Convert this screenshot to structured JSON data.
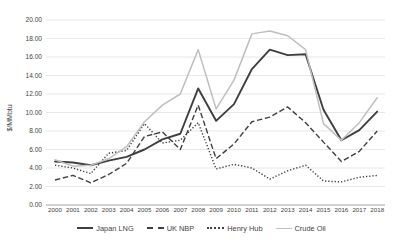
{
  "chart_data": {
    "type": "line",
    "title": "",
    "xlabel": "",
    "ylabel": "$/MMbtu",
    "ylim": [
      0,
      20
    ],
    "ytick_step": 2,
    "grid": "horizontal-only",
    "gridline_color": "#dcdcdc",
    "axis_color": "#999999",
    "legend_position": "bottom",
    "yticks": [
      "0.00",
      "2.00",
      "4.00",
      "6.00",
      "8.00",
      "10.00",
      "12.00",
      "14.00",
      "16.00",
      "18.00",
      "20.00"
    ],
    "x": [
      "2000",
      "2001",
      "2002",
      "2003",
      "2004",
      "2005",
      "2006",
      "2007",
      "2008",
      "2009",
      "2010",
      "2011",
      "2012",
      "2013",
      "2014",
      "2015",
      "2016",
      "2017",
      "2018"
    ],
    "series": [
      {
        "name": "Japan LNG",
        "color": "#3f3f3f",
        "line_style": "solid",
        "line_width": 1.9,
        "values": [
          4.7,
          4.6,
          4.3,
          4.8,
          5.2,
          6.0,
          7.1,
          7.7,
          12.6,
          9.1,
          10.9,
          14.7,
          16.8,
          16.2,
          16.3,
          10.3,
          7.0,
          8.1,
          10.1
        ]
      },
      {
        "name": "UK NBP",
        "color": "#3f3f3f",
        "line_style": "dashed",
        "line_width": 1.4,
        "values": [
          2.7,
          3.2,
          2.4,
          3.3,
          4.5,
          7.4,
          7.9,
          6.0,
          10.8,
          5.0,
          6.6,
          9.0,
          9.5,
          10.6,
          8.9,
          6.8,
          4.7,
          5.8,
          8.0
        ]
      },
      {
        "name": "Henry Hub",
        "color": "#3f3f3f",
        "line_style": "dotted",
        "line_width": 1.4,
        "values": [
          4.3,
          4.0,
          3.4,
          5.6,
          5.9,
          8.8,
          6.7,
          7.0,
          8.9,
          3.9,
          4.4,
          4.0,
          2.8,
          3.7,
          4.3,
          2.6,
          2.5,
          3.0,
          3.2
        ]
      },
      {
        "name": "Crude Oil",
        "color": "#bfbfbf",
        "line_style": "solid",
        "line_width": 1.5,
        "values": [
          4.9,
          4.2,
          4.3,
          5.0,
          6.3,
          9.0,
          10.8,
          12.0,
          16.8,
          10.4,
          13.5,
          18.5,
          18.8,
          18.3,
          16.8,
          8.8,
          7.0,
          8.9,
          11.6
        ]
      }
    ]
  }
}
